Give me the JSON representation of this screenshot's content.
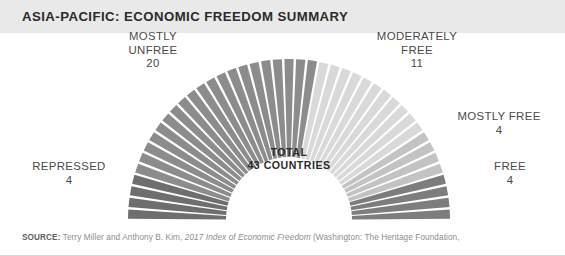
{
  "header": {
    "title": "ASIA-PACIFIC: ECONOMIC FREEDOM SUMMARY",
    "band_color": "#e9e9e9",
    "title_color": "#2b2b2b"
  },
  "center": {
    "total_label": "TOTAL",
    "total_value": "43 COUNTRIES"
  },
  "labels": {
    "mostly_unfree": {
      "name": "MOSTLY\nUNFREE",
      "count": "20"
    },
    "moderately_free": {
      "name": "MODERATELY\nFREE",
      "count": "11"
    },
    "mostly_free": {
      "name": "MOSTLY FREE",
      "count": "4"
    },
    "free": {
      "name": "FREE",
      "count": "4"
    },
    "repressed": {
      "name": "REPRESSED",
      "count": "4"
    }
  },
  "source": {
    "lead": "SOURCE:",
    "text_before": " Terry Miller and Anthony B. Kim, ",
    "italic": "2017 Index of Economic Freedom",
    "text_after": " (Washington: The Heritage Foundation,"
  },
  "chart_data": {
    "type": "pie",
    "variant": "half-donut",
    "title": "ASIA-PACIFIC: ECONOMIC FREEDOM SUMMARY",
    "total": 43,
    "total_label": "TOTAL 43 COUNTRIES",
    "unit": "countries",
    "start_angle_deg": 180,
    "sweep_deg": 180,
    "direction": "clockwise",
    "segment_gap_deg": 0.9,
    "outer_radius": 161,
    "inner_radius": 63,
    "center_x": 289,
    "center_y": 187,
    "legend": "callout-labels",
    "categories": [
      "REPRESSED",
      "MOSTLY UNFREE",
      "MODERATELY FREE",
      "MOSTLY FREE",
      "FREE"
    ],
    "values": [
      4,
      20,
      11,
      4,
      4
    ],
    "colors": [
      "#6e6e6e",
      "#8c8c8c",
      "#d9d9d9",
      "#c3c3c3",
      "#7d7d7d"
    ],
    "slices": [
      {
        "label": "REPRESSED",
        "value": 4,
        "color": "#6e6e6e",
        "divider_color": "#ffffff"
      },
      {
        "label": "MOSTLY UNFREE",
        "value": 20,
        "color": "#8c8c8c",
        "divider_color": "#ffffff"
      },
      {
        "label": "MODERATELY FREE",
        "value": 11,
        "color": "#d9d9d9",
        "divider_color": "#ffffff"
      },
      {
        "label": "MOSTLY FREE",
        "value": 4,
        "color": "#c3c3c3",
        "divider_color": "#ffffff"
      },
      {
        "label": "FREE",
        "value": 4,
        "color": "#7d7d7d",
        "divider_color": "#ffffff"
      }
    ]
  }
}
